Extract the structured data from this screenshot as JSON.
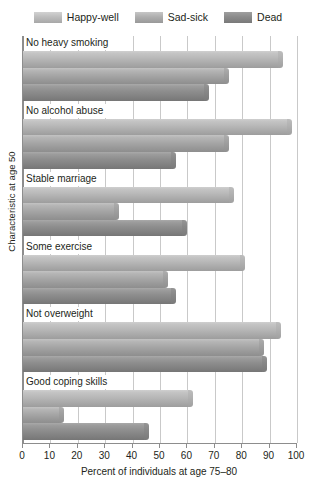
{
  "chart_data": {
    "type": "bar",
    "orientation": "horizontal",
    "title": "",
    "xlabel": "Percent of individuals at age 75–80",
    "ylabel": "Characteristic at age 50",
    "xlim": [
      0,
      100
    ],
    "xticks": [
      0,
      10,
      20,
      30,
      40,
      50,
      60,
      70,
      80,
      90,
      100
    ],
    "xticklabels": [
      "0",
      "10",
      "20",
      "30",
      "40",
      "50",
      "60",
      "70",
      "80",
      "90",
      "100"
    ],
    "grid": true,
    "grid_axis": "x",
    "legend_position": "top",
    "categories": [
      "No heavy smoking",
      "No alcohol abuse",
      "Stable marriage",
      "Some exercise",
      "Not overweight",
      "Good coping skills"
    ],
    "series": [
      {
        "name": "Happy-well",
        "color": "#bdbdbd",
        "values": [
          95,
          98,
          77,
          81,
          94,
          62
        ]
      },
      {
        "name": "Sad-sick",
        "color": "#aeaeae",
        "values": [
          75,
          75,
          35,
          53,
          88,
          15
        ]
      },
      {
        "name": "Dead",
        "color": "#8b8b8b",
        "values": [
          68,
          56,
          60,
          56,
          89,
          46
        ]
      }
    ]
  },
  "legend": {
    "entries": [
      {
        "label": "Happy-well",
        "swatch": "swatch-happy-well"
      },
      {
        "label": "Sad-sick",
        "swatch": "swatch-sad-sick"
      },
      {
        "label": "Dead",
        "swatch": "swatch-dead"
      }
    ]
  },
  "axes": {
    "x_title": "Percent of individuals at age 75–80",
    "y_title": "Characteristic at age 50"
  }
}
